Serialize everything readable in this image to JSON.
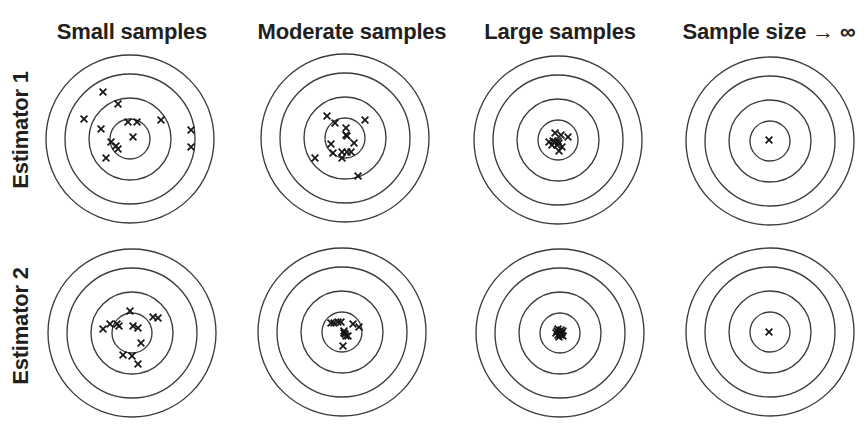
{
  "figure": {
    "background": "#ffffff",
    "text_color": "#231f20",
    "ring_color": "#3d3a3b",
    "mark_color": "#161415",
    "mark_symbol": "x",
    "columns": [
      {
        "label": "Small samples"
      },
      {
        "label": "Moderate samples"
      },
      {
        "label": "Large samples"
      },
      {
        "label": "Sample size → ∞"
      }
    ],
    "rows": [
      {
        "label": "Estimator 1"
      },
      {
        "label": "Estimator 2"
      }
    ],
    "ring_radii": [
      20,
      41,
      65,
      84
    ],
    "targets": [
      {
        "id": "estimator1-small-samples",
        "row": 0,
        "col": 0,
        "cx": 130,
        "cy": 139,
        "marks": [
          [
            -27,
            -47
          ],
          [
            -12,
            -35
          ],
          [
            -46,
            -20
          ],
          [
            -29,
            -10
          ],
          [
            -2,
            -17
          ],
          [
            7,
            -17
          ],
          [
            31,
            -19
          ],
          [
            61,
            -9
          ],
          [
            3,
            -2
          ],
          [
            -19,
            3
          ],
          [
            -14,
            7
          ],
          [
            -12,
            10
          ],
          [
            61,
            8
          ],
          [
            -24,
            19
          ]
        ]
      },
      {
        "id": "estimator1-moderate-samples",
        "row": 0,
        "col": 1,
        "cx": 345,
        "cy": 138,
        "marks": [
          [
            -18,
            -22
          ],
          [
            -10,
            -15
          ],
          [
            20,
            -18
          ],
          [
            1,
            -10
          ],
          [
            1,
            -3
          ],
          [
            2,
            -2
          ],
          [
            9,
            5
          ],
          [
            -14,
            6
          ],
          [
            -12,
            15
          ],
          [
            -3,
            14
          ],
          [
            2,
            14
          ],
          [
            6,
            14
          ],
          [
            -3,
            20
          ],
          [
            -30,
            20
          ],
          [
            13,
            38
          ]
        ]
      },
      {
        "id": "estimator1-large-samples",
        "row": 0,
        "col": 2,
        "cx": 558,
        "cy": 140,
        "marks": [
          [
            -3,
            -7
          ],
          [
            3,
            -5
          ],
          [
            10,
            -3
          ],
          [
            -9,
            2
          ],
          [
            -5,
            1
          ],
          [
            0,
            1
          ],
          [
            -6,
            5
          ],
          [
            -1,
            5
          ],
          [
            4,
            7
          ],
          [
            1,
            11
          ],
          [
            -3,
            2
          ],
          [
            1,
            3
          ]
        ]
      },
      {
        "id": "estimator1-infinite-sample-size",
        "row": 0,
        "col": 3,
        "cx": 770,
        "cy": 141,
        "marks": [
          [
            -1,
            -1
          ]
        ]
      },
      {
        "id": "estimator2-small-samples",
        "row": 1,
        "col": 0,
        "cx": 132,
        "cy": 333,
        "marks": [
          [
            -2,
            -22
          ],
          [
            21,
            -16
          ],
          [
            26,
            -15
          ],
          [
            -22,
            -9
          ],
          [
            -15,
            -9
          ],
          [
            -13,
            -7
          ],
          [
            -29,
            -4
          ],
          [
            1,
            -7
          ],
          [
            6,
            -5
          ],
          [
            9,
            10
          ],
          [
            -9,
            22
          ],
          [
            0,
            23
          ],
          [
            6,
            31
          ]
        ]
      },
      {
        "id": "estimator2-moderate-samples",
        "row": 1,
        "col": 1,
        "cx": 342,
        "cy": 332,
        "marks": [
          [
            -11,
            -9
          ],
          [
            -8,
            -9
          ],
          [
            -4,
            -10
          ],
          [
            -1,
            -10
          ],
          [
            11,
            -8
          ],
          [
            17,
            -5
          ],
          [
            2,
            -1
          ],
          [
            3,
            2
          ],
          [
            4,
            4
          ],
          [
            6,
            4
          ],
          [
            1,
            14
          ],
          [
            2,
            1
          ]
        ]
      },
      {
        "id": "estimator2-large-samples",
        "row": 1,
        "col": 2,
        "cx": 560,
        "cy": 333,
        "marks": [
          [
            -2,
            -4
          ],
          [
            1,
            -3
          ],
          [
            3,
            -2
          ],
          [
            -4,
            0
          ],
          [
            0,
            -1
          ],
          [
            2,
            0
          ],
          [
            -2,
            2
          ],
          [
            1,
            2
          ],
          [
            3,
            3
          ],
          [
            -1,
            4
          ],
          [
            0,
            1
          ],
          [
            -3,
            -2
          ]
        ]
      },
      {
        "id": "estimator2-infinite-sample-size",
        "row": 1,
        "col": 3,
        "cx": 770,
        "cy": 332,
        "marks": [
          [
            -1,
            0
          ]
        ]
      }
    ]
  }
}
